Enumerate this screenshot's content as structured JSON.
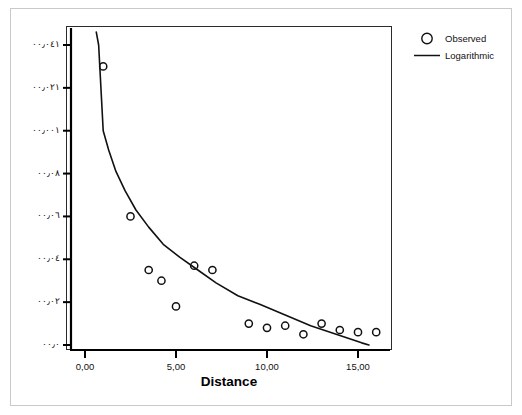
{
  "chart_data": {
    "type": "scatter",
    "title": "",
    "xlabel": "Distance",
    "ylabel": "",
    "xlim": [
      -1.2,
      16.8
    ],
    "ylim": [
      -6,
      146
    ],
    "grid": false,
    "legend_position": "right",
    "x_tick_labels": [
      "0,00",
      "5,00",
      "10,00",
      "15,00"
    ],
    "x_tick_values": [
      0,
      5,
      10,
      15
    ],
    "y_tick_labels": [
      "١٤٠٫٠٠",
      "١٢٠٫٠٠",
      "١٠٠٫٠٠",
      "٨٠٫٠٠",
      "٦٠٫٠٠",
      "٤٠٫٠٠",
      "٢٠٫٠٠",
      "٠٫٠٠"
    ],
    "y_tick_values": [
      140,
      120,
      100,
      80,
      60,
      40,
      20,
      0
    ],
    "series": [
      {
        "name": "Observed",
        "type": "scatter",
        "marker": "open-circle",
        "color": "#111111",
        "points": [
          {
            "x": 1.0,
            "y": 130
          },
          {
            "x": 2.5,
            "y": 60
          },
          {
            "x": 3.5,
            "y": 35
          },
          {
            "x": 4.2,
            "y": 30
          },
          {
            "x": 5.0,
            "y": 18
          },
          {
            "x": 6.0,
            "y": 37
          },
          {
            "x": 7.0,
            "y": 35
          },
          {
            "x": 9.0,
            "y": 10
          },
          {
            "x": 10.0,
            "y": 8
          },
          {
            "x": 11.0,
            "y": 9
          },
          {
            "x": 12.0,
            "y": 5
          },
          {
            "x": 13.0,
            "y": 10
          },
          {
            "x": 14.0,
            "y": 7
          },
          {
            "x": 15.0,
            "y": 6
          },
          {
            "x": 16.0,
            "y": 6
          }
        ]
      },
      {
        "name": "Logarithmic",
        "type": "line",
        "color": "#111111",
        "fit": {
          "a": 100.0,
          "b": -36.0,
          "form": "y = a + b*ln(x)"
        },
        "points": [
          {
            "x": 0.62,
            "y": 146
          },
          {
            "x": 0.75,
            "y": 140
          },
          {
            "x": 1.0,
            "y": 100
          },
          {
            "x": 1.3,
            "y": 91
          },
          {
            "x": 1.7,
            "y": 81
          },
          {
            "x": 2.2,
            "y": 72
          },
          {
            "x": 2.8,
            "y": 63
          },
          {
            "x": 3.5,
            "y": 55
          },
          {
            "x": 4.3,
            "y": 47
          },
          {
            "x": 5.2,
            "y": 41
          },
          {
            "x": 6.2,
            "y": 35
          },
          {
            "x": 7.2,
            "y": 29
          },
          {
            "x": 8.4,
            "y": 23
          },
          {
            "x": 9.6,
            "y": 19
          },
          {
            "x": 11.0,
            "y": 14
          },
          {
            "x": 12.4,
            "y": 9
          },
          {
            "x": 13.8,
            "y": 5
          },
          {
            "x": 15.2,
            "y": 1
          },
          {
            "x": 15.6,
            "y": 0
          }
        ]
      }
    ]
  },
  "legend": {
    "items": [
      {
        "label": "Observed",
        "key": "open-circle"
      },
      {
        "label": "Logarithmic",
        "key": "solid-line"
      }
    ]
  },
  "axis": {
    "x_title": "Distance"
  }
}
